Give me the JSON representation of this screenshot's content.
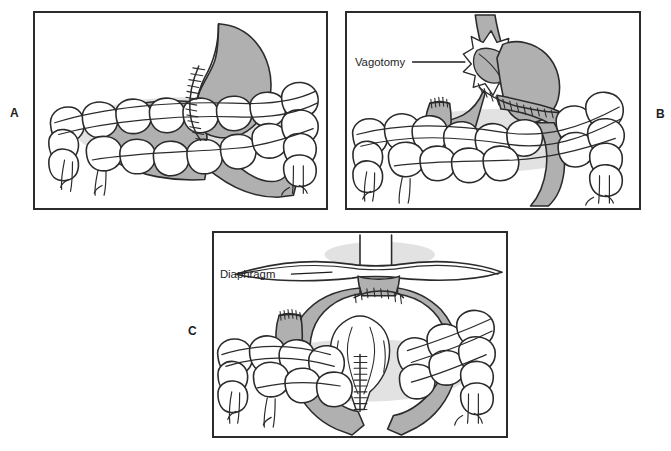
{
  "figure": {
    "background_color": "#ffffff",
    "ink_color": "#2b2b2d",
    "organ_fill_color": "#b0b0b0",
    "bowel_fill_color": "#ffffff",
    "shadow_color": "#d9d9d9",
    "width": 671,
    "height": 451
  },
  "panels": [
    {
      "letter": "A",
      "name": "panel-a",
      "description": "Stomach with sutured gastric closure and colon segment below",
      "labels": []
    },
    {
      "letter": "B",
      "name": "panel-b",
      "description": "Esophagogastric anastomosis with vagotomy and closed colon stump",
      "labels": [
        {
          "text": "Vagotomy",
          "name": "vagotomy-label"
        }
      ]
    },
    {
      "letter": "C",
      "name": "panel-c",
      "description": "Colon interposition graft passed through the diaphragm to the esophagus",
      "labels": [
        {
          "text": "Diaphragm",
          "name": "diaphragm-label"
        }
      ]
    }
  ]
}
